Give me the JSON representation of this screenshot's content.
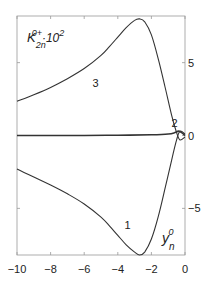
{
  "chart_data": {
    "type": "line",
    "title": "",
    "ylabel": "K_2n^0+ · 10^2",
    "ylabel_parts": {
      "base": "K",
      "sub": "2n",
      "sup": "0+",
      "factor": "·10",
      "factor_sup": "2"
    },
    "xlabel": "y_n^0",
    "xlabel_parts": {
      "base": "y",
      "sub": "n",
      "sup": "0"
    },
    "xlim": [
      -10,
      0
    ],
    "ylim": [
      -8.2,
      8.2
    ],
    "x_ticks": [
      -10,
      -8,
      -6,
      -4,
      -2,
      0
    ],
    "x_tick_labels": [
      "−10",
      "−8",
      "−6",
      "−4",
      "−2",
      "0"
    ],
    "y_ticks": [
      -5,
      0,
      5
    ],
    "y_tick_labels": [
      "−5",
      "0",
      "5"
    ],
    "y_axis_side": "right",
    "grid": false,
    "legend": "inline curve labels",
    "series": [
      {
        "name": "1",
        "label_pos": [
          -3.6,
          -6.4
        ],
        "x": [
          -10,
          -9,
          -8,
          -7,
          -6,
          -5,
          -4.5,
          -4,
          -3.5,
          -3,
          -2.7,
          -2.4,
          -2,
          -1.6,
          -1.2,
          -0.8,
          -0.5,
          -0.3,
          0
        ],
        "y": [
          -2.3,
          -2.85,
          -3.4,
          -4.0,
          -4.7,
          -5.6,
          -6.2,
          -6.85,
          -7.5,
          -8.0,
          -8.2,
          -8.0,
          -7.1,
          -5.6,
          -3.7,
          -1.7,
          -0.3,
          0.3,
          0.1
        ]
      },
      {
        "name": "2",
        "label_pos": [
          -0.8,
          0.6
        ],
        "x": [
          -10,
          -8,
          -6,
          -4,
          -2,
          -1,
          -0.6,
          -0.4,
          -0.2,
          0
        ],
        "y": [
          0.0,
          0.0,
          0.0,
          0.02,
          0.05,
          0.1,
          0.2,
          0.3,
          0.2,
          0.0
        ]
      },
      {
        "name": "3",
        "label_pos": [
          -5.5,
          3.3
        ],
        "x": [
          -10,
          -9,
          -8,
          -7,
          -6,
          -5,
          -4.5,
          -4,
          -3.5,
          -3,
          -2.7,
          -2.4,
          -2,
          -1.6,
          -1.2,
          -0.8,
          -0.5,
          -0.3,
          0
        ],
        "y": [
          2.35,
          2.8,
          3.3,
          3.9,
          4.6,
          5.5,
          6.1,
          6.75,
          7.4,
          7.9,
          8.0,
          7.8,
          6.9,
          5.3,
          3.4,
          1.4,
          0.2,
          -0.3,
          -0.1
        ]
      }
    ]
  }
}
